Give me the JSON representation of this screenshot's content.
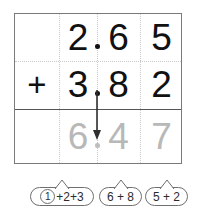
{
  "problem": {
    "type": "column-addition",
    "operator": "+",
    "addend1": {
      "whole": "2",
      "decimal": ".",
      "tenths": "6",
      "hundredths": "5",
      "text": "2.65"
    },
    "addend2": {
      "whole": "3",
      "decimal": ".",
      "tenths": "8",
      "hundredths": "2",
      "text": "3.82"
    },
    "sum": {
      "whole": "6",
      "decimal": ".",
      "tenths": "4",
      "hundredths": "7",
      "text": "6.47"
    }
  },
  "annotations": {
    "arrow_label": "decimal-alignment-arrow",
    "bubbles": [
      {
        "id": "ones-column",
        "carry": "1",
        "expression": "+2+3",
        "full": "1+2+3"
      },
      {
        "id": "tenths-column",
        "carry": "",
        "expression": "6 + 8",
        "full": "6 + 8"
      },
      {
        "id": "hundredths-column",
        "carry": "",
        "expression": "5 + 2",
        "full": "5 + 2"
      }
    ]
  },
  "colors": {
    "ink": "#111111",
    "answer_gray": "#b8b8b8",
    "grid_border": "#7a7a7a",
    "grid_dotted": "#c9c9c9",
    "sum_rule": "#555555",
    "bubble_stroke": "#6f6f6f"
  }
}
